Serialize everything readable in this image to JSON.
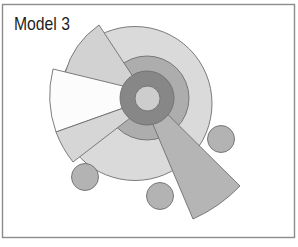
{
  "title": "Model 3",
  "colors": {
    "background": "#ffffff",
    "frame": "#8c8c8c",
    "outline": "#6e6e6e",
    "title_text": "#1e1e1e",
    "outer_circle": "#dadada",
    "middle_ring": "#adadad",
    "inner_ring": "#878787",
    "core": "#cdcdcd",
    "wedge_upper_left": "#d2d2d2",
    "wedge_left_white": "#fcfcfc",
    "wedge_lower_left": "#d6d6d6",
    "wedge_lower_right": "#b5b5b5",
    "satellite_circle": "#b3b3b3"
  }
}
